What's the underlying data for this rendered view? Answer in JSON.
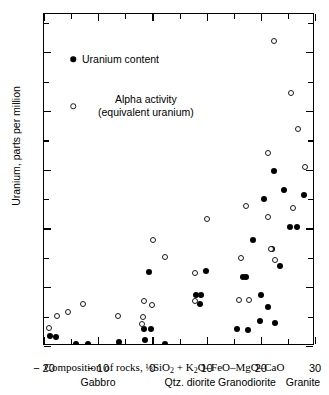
{
  "chart_data": {
    "type": "scatter",
    "title": "",
    "xlabel": "Composition of rocks, 1/3 SiO2 + K2O-FeO-MgO-CaO",
    "ylabel": "Uranium, parts per million",
    "xlim": [
      -20,
      30
    ],
    "ylim": [
      0,
      11.3
    ],
    "xticks": [
      -20,
      -10,
      0,
      10,
      20,
      30
    ],
    "xtick_labels": [
      "− 20",
      "− 10",
      "0",
      "10",
      "20",
      "30"
    ],
    "xticks_minor": [
      -15,
      -5,
      5,
      15,
      25
    ],
    "yticks": [
      0,
      2,
      4,
      6,
      8,
      10
    ],
    "ytick_labels": [
      "0",
      "2",
      "4",
      "6",
      "8",
      "10"
    ],
    "yticks_minor": [
      1,
      3,
      5,
      7,
      9,
      11
    ],
    "grid": false,
    "legend_position": "upper left inside",
    "series": [
      {
        "name": "Uranium content",
        "marker": "filled-circle",
        "color": "#000000",
        "points": [
          [
            -18.9,
            0.35
          ],
          [
            -17.7,
            0.3
          ],
          [
            -14.1,
            0.08
          ],
          [
            -11.9,
            0.07
          ],
          [
            -6.2,
            0.15
          ],
          [
            -1.4,
            0.22
          ],
          [
            -1.5,
            0.58
          ],
          [
            -0.3,
            0.58
          ],
          [
            -0.6,
            2.52
          ],
          [
            2.4,
            0.08
          ],
          [
            8.0,
            1.75
          ],
          [
            8.9,
            1.75
          ],
          [
            8.8,
            1.42
          ],
          [
            9.9,
            2.55
          ],
          [
            15.6,
            0.58
          ],
          [
            17.6,
            0.55
          ],
          [
            16.8,
            2.35
          ],
          [
            17.3,
            2.35
          ],
          [
            18.6,
            3.6
          ],
          [
            19.9,
            0.85
          ],
          [
            20.1,
            1.72
          ],
          [
            21.4,
            1.32
          ],
          [
            22.1,
            3.3
          ],
          [
            22.6,
            0.78
          ],
          [
            22.5,
            5.95
          ],
          [
            20.5,
            5.0
          ],
          [
            23.5,
            2.72
          ],
          [
            25.4,
            4.05
          ],
          [
            26.6,
            4.05
          ],
          [
            24.2,
            5.3
          ],
          [
            27.9,
            5.15
          ]
        ]
      },
      {
        "name": "Alpha activity (equivalent uranium)",
        "marker": "open-circle",
        "color": "#1a1a1a",
        "points": [
          [
            -19.1,
            0.6
          ],
          [
            -17.6,
            1.02
          ],
          [
            -15.5,
            1.15
          ],
          [
            -12.8,
            1.42
          ],
          [
            -6.4,
            1.03
          ],
          [
            -1.6,
            1.52
          ],
          [
            -1.7,
            1.0
          ],
          [
            -1.9,
            0.75
          ],
          [
            0.2,
            3.62
          ],
          [
            0.0,
            1.38
          ],
          [
            2.3,
            3.02
          ],
          [
            7.9,
            2.5
          ],
          [
            7.8,
            1.52
          ],
          [
            10.0,
            4.32
          ],
          [
            15.9,
            1.55
          ],
          [
            16.3,
            2.98
          ],
          [
            17.9,
            1.58
          ],
          [
            17.3,
            4.75
          ],
          [
            21.4,
            4.4
          ],
          [
            21.9,
            3.3
          ],
          [
            22.6,
            2.92
          ],
          [
            21.3,
            6.58
          ],
          [
            22.5,
            10.38
          ],
          [
            25.5,
            8.62
          ],
          [
            25.9,
            4.68
          ],
          [
            26.9,
            7.4
          ],
          [
            28.1,
            6.08
          ]
        ]
      }
    ]
  },
  "legend": {
    "uranium_label": "Uranium content",
    "alpha_label_line1": "Alpha activity",
    "alpha_label_line2": "(equivalent uranium)"
  },
  "axis_titles": {
    "y": "Uranium, parts per million",
    "x_prefix": "Composition of rocks, ",
    "x_fraction": "⅓",
    "x_formula_a": "SiO",
    "x_formula_a_sub": "2",
    "x_formula_b": " + K",
    "x_formula_b_sub": "2",
    "x_formula_c": "O–FeO–MgO–CaO"
  },
  "rock_categories": [
    {
      "label": "Gabbro",
      "x_px": 98
    },
    {
      "label": "Qtz. diorite",
      "x_px": 190
    },
    {
      "label": "Granodiorite",
      "x_px": 247
    },
    {
      "label": "Granite",
      "x_px": 303
    }
  ]
}
